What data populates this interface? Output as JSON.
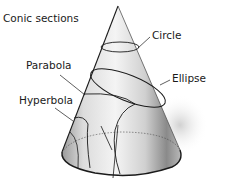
{
  "diagram": {
    "title": "Conic sections",
    "labels": {
      "circle": "Circle",
      "parabola": "Parabola",
      "ellipse": "Ellipse",
      "hyperbola": "Hyperbola"
    },
    "colors": {
      "stroke": "#1a1a1a",
      "shade_dark": "#6e6e6e",
      "shade_light": "#e6e6e6",
      "background": "#ffffff"
    }
  }
}
